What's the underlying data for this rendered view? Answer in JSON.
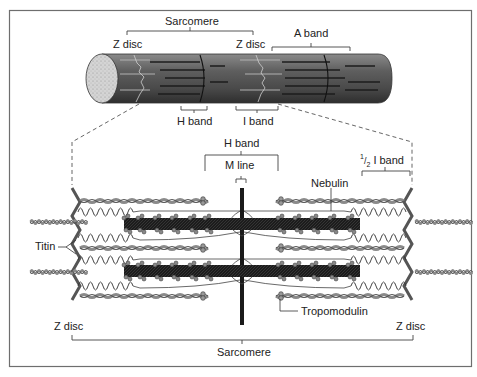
{
  "diagram": {
    "top_fiber": {
      "labels": {
        "sarcomere": "Sarcomere",
        "z_disc_left": "Z disc",
        "z_disc_right": "Z disc",
        "a_band": "A band",
        "h_band": "H band",
        "i_band": "I band"
      }
    },
    "detail": {
      "labels": {
        "h_band": "H band",
        "m_line": "M line",
        "half_i_band_num": "1",
        "half_i_band_den": "2",
        "half_i_band": "I band",
        "nebulin": "Nebulin",
        "titin": "Titin",
        "tropomodulin": "Tropomodulin",
        "z_disc_left": "Z disc",
        "z_disc_right": "Z disc",
        "sarcomere": "Sarcomere"
      }
    },
    "colors": {
      "border": "#6e6e6e",
      "fiber_dark": "#3a3a3a",
      "fiber_mid": "#6a6a6a",
      "fiber_light": "#9a9a9a",
      "end_cap": "#cfcfcf",
      "thick_filament": "#1a1a1a",
      "thin_filament": "#8c8c8c",
      "z_disc": "#555555"
    }
  }
}
